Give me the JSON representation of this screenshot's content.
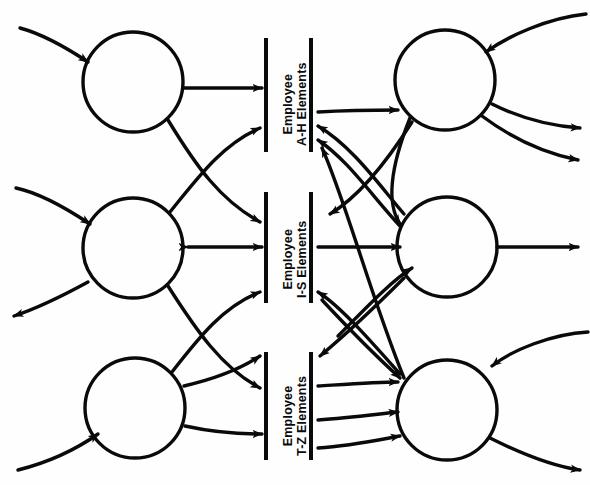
{
  "diagram": {
    "type": "data-flow-diagram",
    "orientation": "rotated-90",
    "background_color": "#fefefe",
    "stroke_color": "#0a0a0a",
    "processes": [
      {
        "id": "p1",
        "label": "",
        "cx": 133,
        "cy": 82,
        "r": 50,
        "position": "top-left"
      },
      {
        "id": "p2",
        "label": "",
        "cx": 133,
        "cy": 248,
        "r": 50,
        "position": "middle-left"
      },
      {
        "id": "p3",
        "label": "",
        "cx": 135,
        "cy": 408,
        "r": 50,
        "position": "bottom-left"
      },
      {
        "id": "p4",
        "label": "",
        "cx": 445,
        "cy": 80,
        "r": 50,
        "position": "top-right"
      },
      {
        "id": "p5",
        "label": "",
        "cx": 447,
        "cy": 247,
        "r": 50,
        "position": "middle-right"
      },
      {
        "id": "p6",
        "label": "",
        "cx": 447,
        "cy": 410,
        "r": 50,
        "position": "bottom-right"
      }
    ],
    "data_stores": [
      {
        "id": "ds1",
        "line1": "Employee",
        "line2": "A-H Elements",
        "x_left_bar": 266,
        "x_right_bar": 311,
        "y_top": 38,
        "y_bottom": 152
      },
      {
        "id": "ds2",
        "line1": "Employee",
        "line2": "I-S Elements",
        "x_left_bar": 266,
        "x_right_bar": 311,
        "y_top": 192,
        "y_bottom": 303
      },
      {
        "id": "ds3",
        "line1": "Employee",
        "line2": "T-Z Elements",
        "x_left_bar": 266,
        "x_right_bar": 311,
        "y_top": 352,
        "y_bottom": 460
      }
    ],
    "flow_counts": {
      "external_in": 5,
      "external_out": 6,
      "internal": 18
    }
  }
}
